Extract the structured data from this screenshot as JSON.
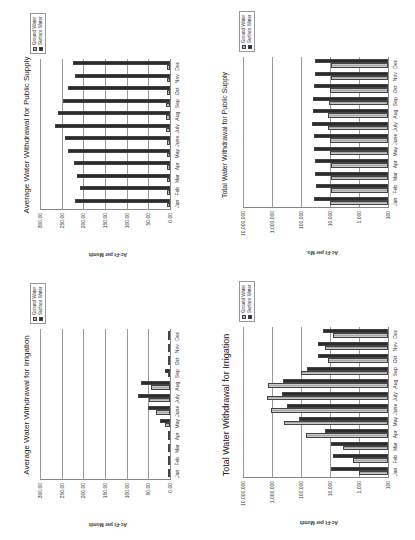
{
  "page": {
    "orientation": "rotated 90deg counter-clockwise",
    "colors": {
      "ground_water": "#b4b4b4",
      "surface_water": "#2b2b2b",
      "grid": "#9a9a9a"
    }
  },
  "legend": {
    "ground_water": "Ground Water",
    "surface_water": "Surface Water"
  },
  "months": [
    "Jan",
    "Feb",
    "Mar",
    "Apr",
    "May",
    "June",
    "July",
    "Aug",
    "Sep",
    "Oct",
    "Nov",
    "Dec"
  ],
  "chart_data": [
    {
      "id": "avg_public_supply",
      "type": "bar",
      "title": "Average Water Withdrawal for Public Supply",
      "xlabel": "",
      "ylabel": "Ac-Ft per Month",
      "yscale": "linear",
      "ylim": [
        0,
        300
      ],
      "yticks": [
        "0.00",
        "50.00",
        "100.00",
        "150.00",
        "200.00",
        "250.00",
        "300.00"
      ],
      "grid": true,
      "legend_position": "right",
      "categories": [
        "Jan",
        "Feb",
        "Mar",
        "Apr",
        "May",
        "June",
        "July",
        "Aug",
        "Sep",
        "Oct",
        "Nov",
        "Dec"
      ],
      "series": [
        {
          "name": "Ground Water",
          "values": [
            8,
            8,
            8,
            8,
            8,
            8,
            9,
            9,
            9,
            8,
            8,
            8
          ]
        },
        {
          "name": "Surface Water",
          "values": [
            220,
            208,
            215,
            222,
            235,
            243,
            265,
            258,
            248,
            235,
            220,
            225
          ]
        }
      ]
    },
    {
      "id": "total_public_supply",
      "type": "bar",
      "title": "Total Water Withdrawal for Public Supply",
      "xlabel": "",
      "ylabel": "Ac-Ft per Mo.",
      "yscale": "log",
      "ylim": [
        100,
        10000000
      ],
      "yticks": [
        "100",
        "1,000",
        "10,000",
        "100,000",
        "1,000,000",
        "10,000,000"
      ],
      "grid": true,
      "legend_position": "right",
      "categories": [
        "Jan",
        "Feb",
        "Mar",
        "Apr",
        "May",
        "June",
        "July",
        "Aug",
        "Sep",
        "Oct",
        "Nov",
        "Dec"
      ],
      "series": [
        {
          "name": "Ground Water",
          "values": [
            10000,
            9000,
            9500,
            9500,
            10000,
            10000,
            12000,
            12000,
            11000,
            10000,
            9000,
            9000
          ]
        },
        {
          "name": "Surface Water",
          "values": [
            35000,
            30000,
            32000,
            33000,
            35000,
            36000,
            42000,
            40000,
            38000,
            35000,
            32000,
            33000
          ]
        }
      ]
    },
    {
      "id": "avg_irrigation",
      "type": "bar",
      "title": "Average Water Withdrawal for Irrigation",
      "xlabel": "",
      "ylabel": "Ac-Ft per Month",
      "yscale": "linear",
      "ylim": [
        0,
        300
      ],
      "yticks": [
        "0.00",
        "50.00",
        "100.00",
        "150.00",
        "200.00",
        "250.00",
        "300.00"
      ],
      "grid": true,
      "legend_position": "right",
      "categories": [
        "Jan",
        "Feb",
        "Mar",
        "Apr",
        "May",
        "June",
        "July",
        "Aug",
        "Sep",
        "Oct",
        "Nov",
        "Dec"
      ],
      "series": [
        {
          "name": "Ground Water",
          "values": [
            0.3,
            0.5,
            1,
            2,
            12,
            33,
            48,
            44,
            3,
            1,
            0.5,
            0.5
          ]
        },
        {
          "name": "Surface Water",
          "values": [
            0.5,
            1,
            1.5,
            2,
            22,
            50,
            74,
            68,
            12,
            3,
            2,
            2
          ]
        }
      ]
    },
    {
      "id": "total_irrigation",
      "type": "bar",
      "title": "Total Water Withdrawal for Irrigation",
      "xlabel": "",
      "ylabel": "Ac-Ft per Month",
      "yscale": "log",
      "ylim": [
        100,
        10000000
      ],
      "yticks": [
        "100",
        "1,000",
        "10,000",
        "100,000",
        "1,000,000",
        "10,000,000"
      ],
      "grid": true,
      "legend_position": "right",
      "categories": [
        "Jan",
        "Feb",
        "Mar",
        "Apr",
        "May",
        "June",
        "July",
        "Aug",
        "Sep",
        "Oct",
        "Nov",
        "Dec"
      ],
      "series": [
        {
          "name": "Ground Water",
          "values": [
            1000,
            1600,
            3500,
            70000,
            400000,
            1100000,
            1500000,
            1400000,
            100000,
            12000,
            15000,
            8000
          ]
        },
        {
          "name": "Surface Water",
          "values": [
            9000,
            8000,
            9500,
            15000,
            120000,
            300000,
            450000,
            430000,
            60000,
            25000,
            25000,
            18000
          ]
        }
      ]
    }
  ]
}
